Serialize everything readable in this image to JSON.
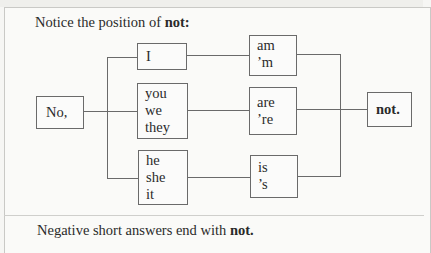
{
  "title": {
    "prefix": "Notice the position of ",
    "bold": "not:"
  },
  "diagram": {
    "start": "No,",
    "subjects": [
      {
        "lines": [
          "I"
        ]
      },
      {
        "lines": [
          "you",
          "we",
          "they"
        ]
      },
      {
        "lines": [
          "he",
          "she",
          "it"
        ]
      }
    ],
    "verbs": [
      {
        "lines": [
          "am",
          "’m"
        ]
      },
      {
        "lines": [
          "are",
          "’re"
        ]
      },
      {
        "lines": [
          "is",
          "’s"
        ]
      }
    ],
    "end": "not."
  },
  "footer": {
    "prefix": "Negative short answers end with ",
    "bold": "not."
  },
  "colors": {
    "line": "#6a6a6a",
    "background": "#fafaf8",
    "border": "#c9c9c6"
  }
}
